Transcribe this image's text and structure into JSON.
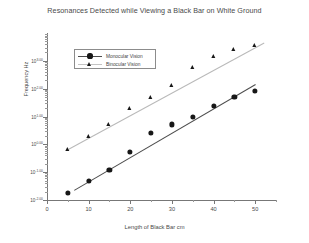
{
  "chart_data": {
    "type": "scatter",
    "title": "Resonances Detected while Viewing a Black Bar on White Ground",
    "xlabel": "Length of Black Bar cm",
    "ylabel": "Frequency Hz",
    "yscale": "log",
    "xlim": [
      0,
      55
    ],
    "ylim": [
      0.01,
      10000
    ],
    "grid": false,
    "legend_position": "upper-left",
    "x": [
      5,
      10,
      15,
      20,
      25,
      30,
      35,
      40,
      45,
      50
    ],
    "xticks": [
      "0",
      "10",
      "20",
      "30",
      "40",
      "50"
    ],
    "xtick_values": [
      0,
      10,
      20,
      30,
      40,
      50
    ],
    "ytick_labels": [
      {
        "mantissa": "10",
        "exponent": "3.00"
      },
      {
        "mantissa": "10",
        "exponent": "2.00"
      },
      {
        "mantissa": "10",
        "exponent": "1.00"
      },
      {
        "mantissa": "10",
        "exponent": "0.00"
      },
      {
        "mantissa": "10",
        "exponent": "-1.00"
      },
      {
        "mantissa": "10",
        "exponent": "-2.00"
      }
    ],
    "ytick_values": [
      1000,
      100,
      10,
      1,
      0.1,
      0.01
    ],
    "series": [
      {
        "name": "Monocular Vision",
        "marker": "circle",
        "color": "#171717",
        "line_color": "#4d4d4d",
        "values": [
          0.018,
          0.05,
          0.12,
          0.55,
          2.5,
          5.2,
          10.0,
          24.0,
          52.0,
          85.0
        ],
        "fit_endpoints": [
          [
            6.5,
            0.022
          ],
          [
            50.0,
            140.0
          ]
        ]
      },
      {
        "name": "Binocular Vision",
        "marker": "triangle",
        "color": "#171717",
        "line_color": "#b9b9b9",
        "values": [
          0.62,
          1.8,
          5.0,
          18.0,
          48.0,
          125.0,
          560.0,
          1400.0,
          2500.0,
          3300.0
        ],
        "fit_endpoints": [
          [
            5.0,
            0.7
          ],
          [
            52.0,
            4600.0
          ]
        ]
      }
    ]
  },
  "legend": {
    "entries": [
      {
        "label": "Monocular Vision"
      },
      {
        "label": "Binocular Vision"
      }
    ]
  }
}
